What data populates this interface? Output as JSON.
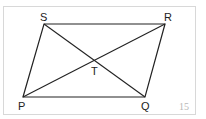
{
  "figure": {
    "number": "15",
    "shape": "parallelogram",
    "vertices": {
      "S": {
        "label": "S",
        "x": 44,
        "y": 24
      },
      "R": {
        "label": "R",
        "x": 165,
        "y": 24
      },
      "Q": {
        "label": "Q",
        "x": 145,
        "y": 97
      },
      "P": {
        "label": "P",
        "x": 23,
        "y": 97
      }
    },
    "intersection": {
      "label": "T",
      "x": 94,
      "y": 61
    },
    "diagonals": [
      "PR",
      "SQ"
    ],
    "colors": {
      "stroke": "#222222",
      "frame": "#d8d8d8",
      "number": "#b8b8b8"
    }
  }
}
